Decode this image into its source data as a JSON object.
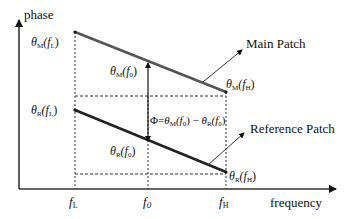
{
  "axes": {
    "y_label": "phase",
    "x_label": "frequency"
  },
  "x_ticks": [
    {
      "base": "f",
      "sub": "L"
    },
    {
      "base": "f",
      "sub": "0"
    },
    {
      "base": "f",
      "sub": "H"
    }
  ],
  "main_line": {
    "label": "Main Patch",
    "start_label": {
      "base": "θ",
      "sub": "M",
      "arg": "(f",
      "arg_sub": "L",
      "close": ")"
    },
    "end_label": {
      "base": "θ",
      "sub": "M",
      "arg": "(f",
      "arg_sub": "H",
      "close": ")"
    },
    "mid_label": {
      "base": "θ",
      "sub": "M",
      "arg": "(f",
      "arg_sub": "0",
      "close": ")"
    },
    "color": "#555555"
  },
  "reference_line": {
    "label": "Reference Patch",
    "start_label": {
      "base": "θ",
      "sub": "R",
      "arg": "(f",
      "arg_sub": "L",
      "close": ")"
    },
    "end_label": {
      "base": "θ",
      "sub": "R",
      "arg": "(f",
      "arg_sub": "H",
      "close": ")"
    },
    "mid_label": {
      "base": "θ",
      "sub": "R",
      "arg": "(f",
      "arg_sub": "0",
      "close": ")"
    },
    "color": "#222222"
  },
  "difference": {
    "lhs": "Φ=",
    "a_base": "θ",
    "a_sub": "M",
    "a_arg": "(f",
    "a_arg_sub": "0",
    "a_close": ")",
    "minus": " − ",
    "b_base": "θ",
    "b_sub": "R",
    "b_arg": "(f",
    "b_arg_sub": "0",
    "b_close": ")"
  }
}
